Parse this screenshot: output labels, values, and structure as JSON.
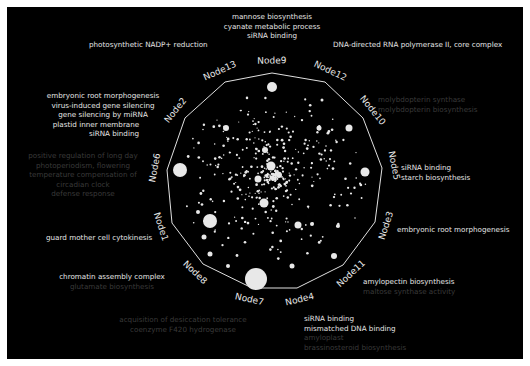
{
  "figure": {
    "background": "#000000",
    "border_color": "#ffffff",
    "ring_color": "#e0e0e0",
    "point_color": "#e8e8e8",
    "dim_text_color": "#3a3a3a",
    "bright_text_color": "#e6e6e6"
  },
  "nodes": [
    {
      "name": "Node9",
      "x": 272,
      "y": 73
    },
    {
      "name": "Node12",
      "x": 325,
      "y": 82
    },
    {
      "name": "Node10",
      "x": 363,
      "y": 118
    },
    {
      "name": "Node5",
      "x": 382,
      "y": 168
    },
    {
      "name": "Node3",
      "x": 375,
      "y": 222
    },
    {
      "name": "Node11",
      "x": 343,
      "y": 265
    },
    {
      "name": "Node4",
      "x": 297,
      "y": 288
    },
    {
      "name": "Node7",
      "x": 252,
      "y": 288
    },
    {
      "name": "Node8",
      "x": 203,
      "y": 264
    },
    {
      "name": "Node1",
      "x": 172,
      "y": 223
    },
    {
      "name": "Node6",
      "x": 167,
      "y": 170
    },
    {
      "name": "Node2",
      "x": 185,
      "y": 118
    },
    {
      "name": "Node13",
      "x": 225,
      "y": 82
    }
  ],
  "annotations": {
    "node9": {
      "bright": [
        "mannose biosynthesis",
        "cyanate metabolic process",
        "siRNA binding"
      ],
      "dim": []
    },
    "node13": {
      "bright": [
        "photosynthetic NADP+ reduction"
      ],
      "dim": []
    },
    "node12": {
      "bright": [
        "DNA-directed RNA polymerase II, core complex"
      ],
      "dim": []
    },
    "node10": {
      "bright": [],
      "dim": [
        "molybdopterin synthase",
        "molybdopterin biosynthesis"
      ]
    },
    "node2": {
      "bright": [
        "embryonic root morphogenesis",
        "virus-induced gene silencing",
        "gene silencing by miRNA",
        "plastid inner membrane",
        "siRNA binding"
      ],
      "dim": []
    },
    "node6": {
      "bright": [],
      "dim": [
        "positive regulation of long day",
        "photoperiodism, flowering",
        "temperature compensation of",
        "circadian clock",
        "defense response"
      ]
    },
    "node5": {
      "bright": [
        "siRNA binding",
        "starch biosynthesis"
      ],
      "dim": []
    },
    "node3": {
      "bright": [
        "embryonic root morphogenesis"
      ],
      "dim": []
    },
    "node1": {
      "bright": [
        "guard mother cell cytokinesis"
      ],
      "dim": []
    },
    "node8": {
      "bright": [
        "chromatin assembly complex"
      ],
      "dim": [
        "glutamate biosynthesis"
      ]
    },
    "node11": {
      "bright": [
        "amylopectin biosynthesis"
      ],
      "dim": [
        "maltose synthase activity"
      ]
    },
    "node7": {
      "bright": [],
      "dim": [
        "acquisition of desiccation tolerance",
        "coenzyme F420 hydrogenase"
      ]
    },
    "node4": {
      "bright": [
        "siRNA binding",
        "mismatched DNA binding"
      ],
      "dim": [
        "amyloplast",
        "brassinosteroid biosynthesis"
      ]
    }
  },
  "large_points": [
    {
      "x": 272,
      "y": 87,
      "r": 5
    },
    {
      "x": 322,
      "y": 100,
      "r": 1.5
    },
    {
      "x": 349,
      "y": 128,
      "r": 3.5
    },
    {
      "x": 365,
      "y": 172,
      "r": 4.5
    },
    {
      "x": 180,
      "y": 170,
      "r": 7
    },
    {
      "x": 226,
      "y": 128,
      "r": 3
    },
    {
      "x": 319,
      "y": 128,
      "r": 2.5
    },
    {
      "x": 210,
      "y": 221,
      "r": 7
    },
    {
      "x": 256,
      "y": 279,
      "r": 11
    },
    {
      "x": 264,
      "y": 203,
      "r": 4.5
    },
    {
      "x": 271,
      "y": 166,
      "r": 4.5
    },
    {
      "x": 258,
      "y": 179,
      "r": 3.5
    },
    {
      "x": 279,
      "y": 175,
      "r": 3
    },
    {
      "x": 265,
      "y": 150,
      "r": 3
    },
    {
      "x": 298,
      "y": 225,
      "r": 3.5
    },
    {
      "x": 334,
      "y": 256,
      "r": 3
    },
    {
      "x": 210,
      "y": 254,
      "r": 2.5
    },
    {
      "x": 228,
      "y": 266,
      "r": 2
    },
    {
      "x": 292,
      "y": 266,
      "r": 2.5
    },
    {
      "x": 204,
      "y": 237,
      "r": 2.5
    },
    {
      "x": 198,
      "y": 212,
      "r": 2
    },
    {
      "x": 338,
      "y": 226,
      "r": 2
    },
    {
      "x": 312,
      "y": 224,
      "r": 2
    }
  ]
}
